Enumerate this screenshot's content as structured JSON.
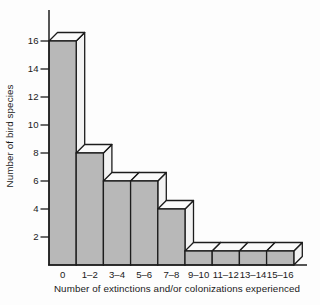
{
  "figure": {
    "background": "#fdfdfd",
    "bar_front_color": "#b8b8b8",
    "bar_side_color": "#f3f3f3",
    "bar_top_color": "#fbfbfb",
    "outline_color": "#1c1c1c",
    "axis_color": "#1c1c1c"
  },
  "chart_data": {
    "type": "bar",
    "style": "3d-histogram",
    "title": "",
    "xlabel": "Number of extinctions and/or colonizations experienced",
    "ylabel": "Number of bird species",
    "categories": [
      "0",
      "1–2",
      "3–4",
      "5–6",
      "7–8",
      "9–10",
      "11–12",
      "13–14",
      "15–16"
    ],
    "values": [
      16,
      8,
      6,
      6,
      4,
      1,
      1,
      1,
      1
    ],
    "yticks": [
      2,
      4,
      6,
      8,
      10,
      12,
      14,
      16
    ],
    "ylim": [
      0,
      16
    ],
    "grid": false,
    "legend": null
  }
}
